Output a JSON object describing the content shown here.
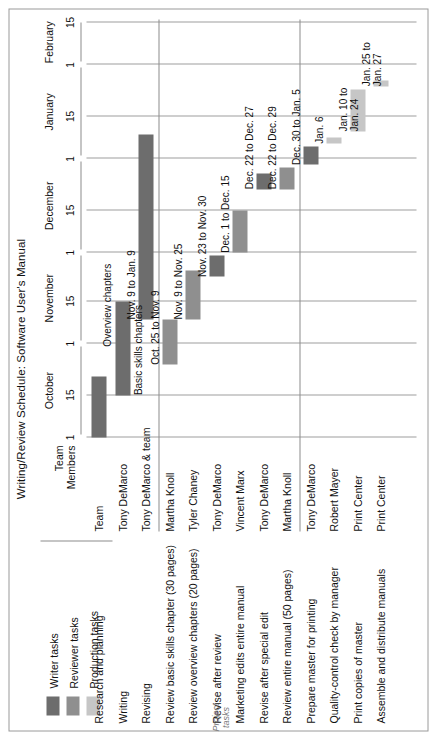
{
  "title": "Writing/Review Schedule: Software User's Manual",
  "legend": {
    "items": [
      {
        "label": "Writer tasks",
        "color": "#6d6d6d"
      },
      {
        "label": "Reviewer tasks",
        "color": "#8f8f8f"
      },
      {
        "label": "Production tasks",
        "color": "#c6c6c6"
      }
    ]
  },
  "headers": {
    "team_members": "Team\nMembers",
    "team_members_line1": "Team",
    "team_members_line2": "Members",
    "project_tasks_line1": "Project",
    "project_tasks_line2": "tasks"
  },
  "axis": {
    "months": [
      "October",
      "November",
      "December",
      "January",
      "February"
    ],
    "ticks": [
      "1",
      "15",
      "1",
      "15",
      "1",
      "15",
      "1",
      "15",
      "1",
      "15"
    ],
    "range_start": "Oct 1",
    "range_end": "Feb 15"
  },
  "chart_data": {
    "type": "bar",
    "title": "Writing/Review Schedule: Software User's Manual",
    "xlabel": "",
    "ylabel": "",
    "orientation": "horizontal-gantt",
    "axis_months": [
      "October",
      "November",
      "December",
      "January",
      "February"
    ],
    "axis_ticks": [
      "1",
      "15",
      "1",
      "15",
      "1",
      "15",
      "1",
      "15",
      "1",
      "15"
    ],
    "categories": [
      "Research and planning",
      "Writing",
      "Revising",
      "Review basic skills chapter (30 pages)",
      "Review overview chapters (20 pages)",
      "Revise after review",
      "Marketing edits entire manual",
      "Revise after special edit",
      "Review entire manual (50 pages)",
      "Prepare master for printing",
      "Quality-control check by manager",
      "Print copies of master",
      "Assemble and distribute manuals"
    ],
    "series": [
      {
        "name": "Writer tasks",
        "color": "#6d6d6d",
        "bars": [
          {
            "task": "Research and planning",
            "start_day": 0,
            "end_day": 20,
            "label": "",
            "member": "Team"
          },
          {
            "task": "Writing",
            "start_day": 14,
            "end_day": 45,
            "label": "Basic skills chapters",
            "label2": "Overview chapters",
            "member": "Tony DeMarco"
          },
          {
            "task": "Revising",
            "start_day": 39,
            "end_day": 100,
            "label": "Nov. 9 to Jan. 9",
            "member": "Tony DeMarco & team"
          },
          {
            "task": "Revise after review",
            "start_day": 53,
            "end_day": 60,
            "label": "Nov. 23 to Nov. 30",
            "member": "Tony DeMarco"
          },
          {
            "task": "Revise after special edit",
            "start_day": 82,
            "end_day": 87,
            "label": "Dec. 22 to Dec. 27",
            "member": "Tony DeMarco"
          },
          {
            "task": "Prepare master for printing",
            "start_day": 90,
            "end_day": 96,
            "label": "Dec. 30 to Jan. 5",
            "member": "Tony DeMarco"
          }
        ]
      },
      {
        "name": "Reviewer tasks",
        "color": "#8f8f8f",
        "bars": [
          {
            "task": "Review basic skills chapter (30 pages)",
            "start_day": 24,
            "end_day": 39,
            "label": "Oct. 25 to Nov. 9",
            "member": "Martha Knoll"
          },
          {
            "task": "Review overview chapters (20 pages)",
            "start_day": 39,
            "end_day": 55,
            "label": "Nov. 9 to Nov. 25",
            "member": "Tyler Chaney"
          },
          {
            "task": "Marketing edits entire manual",
            "start_day": 61,
            "end_day": 75,
            "label": "Dec. 1 to Dec. 15",
            "member": "Vincent Marx"
          },
          {
            "task": "Review entire manual (50 pages)",
            "start_day": 82,
            "end_day": 89,
            "label": "Dec. 22 to Dec. 29",
            "member": "Martha Knoll"
          }
        ]
      },
      {
        "name": "Production tasks",
        "color": "#c6c6c6",
        "bars": [
          {
            "task": "Quality-control check by manager",
            "start_day": 97,
            "end_day": 99,
            "label": "Jan. 6",
            "member": "Robert Mayer"
          },
          {
            "task": "Print copies of master",
            "start_day": 101,
            "end_day": 115,
            "label": "Jan. 10 to",
            "label2": "Jan. 24",
            "member": "Print Center"
          },
          {
            "task": "Assemble and distribute manuals",
            "start_day": 116,
            "end_day": 118,
            "label": "Jan. 25 to",
            "label2": "Jan. 27",
            "member": "Print Center"
          }
        ]
      }
    ],
    "groups": [
      {
        "name": "Writer group 1",
        "rows": [
          0,
          1,
          2
        ]
      },
      {
        "name": "Project tasks",
        "rows": [
          3,
          4,
          5,
          6,
          7,
          8
        ]
      },
      {
        "name": "Production",
        "rows": [
          9,
          10,
          11,
          12
        ]
      }
    ]
  },
  "rows": [
    {
      "task": "Research and planning",
      "member": "Team",
      "type": "writer",
      "start": 0,
      "end": 20,
      "label": "",
      "label2": ""
    },
    {
      "task": "Writing",
      "member": "Tony DeMarco",
      "type": "writer",
      "start": 14,
      "end": 45,
      "label": "",
      "label2": ""
    },
    {
      "task": "Revising",
      "member": "Tony DeMarco & team",
      "type": "writer",
      "start": 39,
      "end": 100,
      "label": "Nov. 9 to Jan. 9",
      "label2": ""
    },
    {
      "task": "Review basic skills chapter (30 pages)",
      "member": "Martha Knoll",
      "type": "reviewer",
      "start": 24,
      "end": 39,
      "label": "Oct. 25 to Nov. 9",
      "label2": ""
    },
    {
      "task": "Review overview chapters (20 pages)",
      "member": "Tyler Chaney",
      "type": "reviewer",
      "start": 39,
      "end": 55,
      "label": "Nov. 9 to Nov. 25",
      "label2": ""
    },
    {
      "task": "Revise after review",
      "member": "Tony DeMarco",
      "type": "writer",
      "start": 53,
      "end": 60,
      "label": "Nov. 23 to Nov. 30",
      "label2": ""
    },
    {
      "task": "Marketing edits entire manual",
      "member": "Vincent Marx",
      "type": "reviewer",
      "start": 61,
      "end": 75,
      "label": "Dec. 1 to Dec. 15",
      "label2": ""
    },
    {
      "task": "Revise after special edit",
      "member": "Tony DeMarco",
      "type": "writer",
      "start": 82,
      "end": 87,
      "label": "Dec. 22 to Dec. 27",
      "label2": ""
    },
    {
      "task": "Review entire manual (50 pages)",
      "member": "Martha Knoll",
      "type": "reviewer",
      "start": 82,
      "end": 89,
      "label": "Dec. 22 to Dec. 29",
      "label2": ""
    },
    {
      "task": "Prepare master for printing",
      "member": "Tony DeMarco",
      "type": "writer",
      "start": 90,
      "end": 96,
      "label": "Dec. 30 to Jan. 5",
      "label2": ""
    },
    {
      "task": "Quality-control check by manager",
      "member": "Robert Mayer",
      "type": "production",
      "start": 97,
      "end": 99,
      "label": "Jan. 6",
      "label2": ""
    },
    {
      "task": "Print copies of master",
      "member": "Print Center",
      "type": "production",
      "start": 101,
      "end": 115,
      "label": "Jan. 10 to",
      "label2": "Jan. 24"
    },
    {
      "task": "Assemble and distribute manuals",
      "member": "Print Center",
      "type": "production",
      "start": 116,
      "end": 118,
      "label": "Jan. 25 to",
      "label2": "Jan. 27"
    }
  ],
  "bar_annotations": {
    "writing_basic": "Basic skills chapters",
    "writing_overview": "Overview chapters"
  },
  "colors": {
    "writer": "#6d6d6d",
    "reviewer": "#8f8f8f",
    "production": "#c6c6c6",
    "gridline": "#9d9d9d",
    "frame": "#9a9a9a",
    "text": "#111111",
    "group_label": "#7a7a7a"
  }
}
